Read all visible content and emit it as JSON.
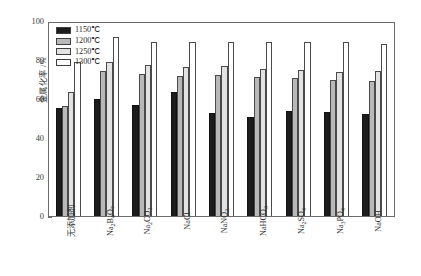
{
  "chart_data": {
    "type": "bar",
    "title": "",
    "xlabel": "",
    "ylabel": "金属化率 /%",
    "ylim": [
      0,
      100
    ],
    "yticks": [
      0,
      20,
      40,
      60,
      80,
      100
    ],
    "grid": false,
    "legend_position": "upper-left-inside",
    "categories": [
      "无添加剂",
      "Na2B4O7",
      "Na2CO3",
      "NaCl",
      "NaNO3",
      "NaHCO3",
      "Na2SO4",
      "Na3PO4",
      "NaOH"
    ],
    "categories_display": [
      {
        "base": "无添加剂",
        "parts": [
          {
            "t": "无添加剂",
            "sub": false
          }
        ]
      },
      {
        "base": "Na2B4O7",
        "parts": [
          {
            "t": "Na",
            "sub": false
          },
          {
            "t": "2",
            "sub": true
          },
          {
            "t": "B",
            "sub": false
          },
          {
            "t": "4",
            "sub": true
          },
          {
            "t": "O",
            "sub": false
          },
          {
            "t": "7",
            "sub": true
          }
        ]
      },
      {
        "base": "Na2CO3",
        "parts": [
          {
            "t": "Na",
            "sub": false
          },
          {
            "t": "2",
            "sub": true
          },
          {
            "t": "CO",
            "sub": false
          },
          {
            "t": "3",
            "sub": true
          }
        ]
      },
      {
        "base": "NaCl",
        "parts": [
          {
            "t": "NaCl",
            "sub": false
          }
        ]
      },
      {
        "base": "NaNO3",
        "parts": [
          {
            "t": "NaNO",
            "sub": false
          },
          {
            "t": "3",
            "sub": true
          }
        ]
      },
      {
        "base": "NaHCO3",
        "parts": [
          {
            "t": "NaHCO",
            "sub": false
          },
          {
            "t": "3",
            "sub": true
          }
        ]
      },
      {
        "base": "Na2SO4",
        "parts": [
          {
            "t": "Na",
            "sub": false
          },
          {
            "t": "2",
            "sub": true
          },
          {
            "t": "SO",
            "sub": false
          },
          {
            "t": "4",
            "sub": true
          }
        ]
      },
      {
        "base": "Na3PO4",
        "parts": [
          {
            "t": "Na",
            "sub": false
          },
          {
            "t": "3",
            "sub": true
          },
          {
            "t": "PO",
            "sub": false
          },
          {
            "t": "4",
            "sub": true
          }
        ]
      },
      {
        "base": "NaOH",
        "parts": [
          {
            "t": "NaOH",
            "sub": false
          }
        ]
      }
    ],
    "series": [
      {
        "name": "1150℃",
        "color": "#1c1c1c",
        "values": [
          55.8,
          60.5,
          57.3,
          64.0,
          53.2,
          51.5,
          54.3,
          54.0,
          52.6
        ]
      },
      {
        "name": "1200℃",
        "color": "#b8b8b8",
        "values": [
          57.0,
          75.2,
          73.5,
          72.3,
          73.0,
          71.8,
          71.3,
          70.5,
          70.0
        ]
      },
      {
        "name": "1250℃",
        "color": "#e2e2e2",
        "values": [
          64.4,
          80.0,
          78.0,
          77.0,
          77.5,
          76.2,
          75.8,
          74.7,
          75.0
        ]
      },
      {
        "name": "1300℃",
        "color": "#ffffff",
        "values": [
          79.8,
          93.0,
          90.0,
          90.0,
          90.0,
          90.0,
          90.0,
          90.0,
          89.0
        ]
      }
    ]
  },
  "legend": {
    "entries": [
      "1150℃",
      "1200℃",
      "1250℃",
      "1300℃"
    ]
  }
}
